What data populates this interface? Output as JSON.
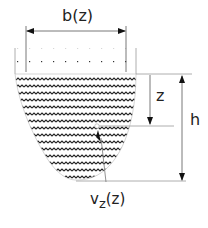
{
  "diagram": {
    "labels": {
      "width": "b(z)",
      "depth": "z",
      "height": "h",
      "velocity_main": "v",
      "velocity_sub": "z",
      "velocity_arg": "(z)"
    },
    "colors": {
      "line": "#222222",
      "wave": "#222222",
      "dots": "#333333",
      "background": "#ffffff"
    }
  }
}
